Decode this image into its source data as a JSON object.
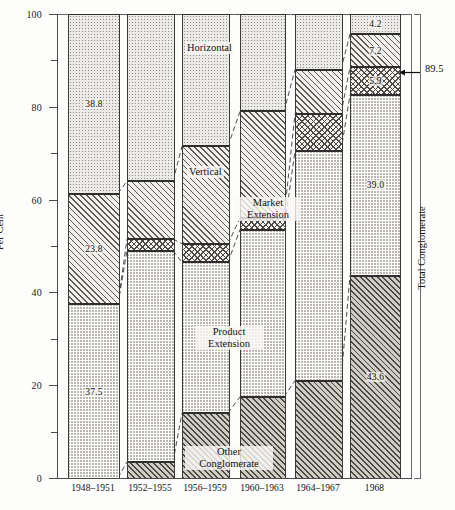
{
  "chart_data": {
    "type": "bar",
    "title": "",
    "xlabel": "",
    "ylabel": "Per Cent",
    "ylim": [
      0,
      100
    ],
    "grid": false,
    "stacked": true,
    "legend_position": "inline-annotations",
    "categories": [
      "1948–1951",
      "1952–1955",
      "1956–1959",
      "1960–1963",
      "1964–1967",
      "1968"
    ],
    "y_ticks": [
      0,
      20,
      40,
      60,
      80,
      100
    ],
    "y_tick_labels": [
      "0",
      "20",
      "40",
      "60",
      "80",
      "100"
    ],
    "y_minor_ticks": [
      10,
      30,
      50,
      70,
      90
    ],
    "series": [
      {
        "name": "Other Conglomerate",
        "pattern": "diagonal-hatch-dense",
        "values": [
          0.0,
          3.5,
          14.0,
          17.5,
          21.0,
          43.6
        ],
        "labels": [
          "",
          "",
          "",
          "",
          "",
          "43.6"
        ]
      },
      {
        "name": "Product Extension",
        "pattern": "dotted-grey",
        "values": [
          37.5,
          45.5,
          32.5,
          36.0,
          49.5,
          39.0
        ],
        "labels": [
          "37.5",
          "",
          "",
          "",
          "",
          "39.0"
        ]
      },
      {
        "name": "Market Extension",
        "pattern": "cross-hatch",
        "values": [
          0.0,
          2.5,
          4.0,
          2.5,
          8.0,
          5.9
        ],
        "labels": [
          "",
          "",
          "",
          "",
          "",
          "5.9"
        ]
      },
      {
        "name": "Vertical",
        "pattern": "diagonal-hatch-open",
        "values": [
          23.8,
          12.5,
          21.0,
          23.0,
          9.5,
          7.2
        ],
        "labels": [
          "23.8",
          "",
          "",
          "",
          "",
          "7.2"
        ]
      },
      {
        "name": "Horizontal",
        "pattern": "fine-dots-light",
        "values": [
          38.8,
          36.0,
          28.5,
          21.0,
          12.0,
          4.2
        ],
        "labels": [
          "38.8",
          "",
          "",
          "",
          "",
          "4.2"
        ]
      }
    ],
    "annotations": [
      {
        "name": "total-conglomerate-bracket",
        "text": "Total Conglomerate"
      },
      {
        "name": "total-conglomerate-value",
        "text": "89.5",
        "y_value": 89.5
      }
    ]
  },
  "axis": {
    "y_title": "Per Cent"
  },
  "inline_labels": {
    "horizontal": "Horizontal",
    "vertical": "Vertical",
    "market_extension_line1": "Market",
    "market_extension_line2": "Extension",
    "product_extension_line1": "Product",
    "product_extension_line2": "Extension",
    "other_conglomerate_line1": "Other",
    "other_conglomerate_line2": "Conglomerate"
  },
  "right_annotation": {
    "bracket_label": "Total Conglomerate",
    "value": "89.5"
  }
}
